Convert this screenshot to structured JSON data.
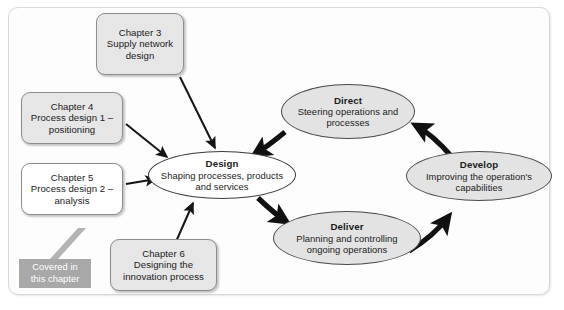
{
  "figure": {
    "frame_color": "#d8d8d8",
    "background": "#ffffff"
  },
  "cycle": {
    "nodes": [
      {
        "id": "design",
        "title": "Design",
        "subtitle": "Shaping processes, products and services",
        "fill": "#ffffff",
        "highlighted": true
      },
      {
        "id": "direct",
        "title": "Direct",
        "subtitle": "Steering operations and processes",
        "fill": "#e3e3e3",
        "highlighted": false
      },
      {
        "id": "develop",
        "title": "Develop",
        "subtitle": "Improving the operation's capabilities",
        "fill": "#e3e3e3",
        "highlighted": false
      },
      {
        "id": "deliver",
        "title": "Deliver",
        "subtitle": "Planning and controlling ongoing operations",
        "fill": "#e3e3e3",
        "highlighted": false
      }
    ],
    "flow_order": [
      "design",
      "deliver",
      "develop",
      "direct",
      "design"
    ]
  },
  "chapters": [
    {
      "id": "chapter-3",
      "title": "Chapter 3",
      "subtitle": "Supply network design",
      "fill": "#e6e6e6",
      "points_to": "design"
    },
    {
      "id": "chapter-4",
      "title": "Chapter 4",
      "subtitle": "Process design 1 – positioning",
      "fill": "#e6e6e6",
      "points_to": "design"
    },
    {
      "id": "chapter-5",
      "title": "Chapter 5",
      "subtitle": "Process design 2 – analysis",
      "fill": "#ffffff",
      "points_to": "design"
    },
    {
      "id": "chapter-6",
      "title": "Chapter 6",
      "subtitle": "Designing the innovation process",
      "fill": "#e6e6e6",
      "points_to": "design"
    }
  ],
  "callout": {
    "line1": "Covered in",
    "line2": "this chapter",
    "fill": "#a8a8a8",
    "text_color": "#ffffff",
    "anchor": "chapter-5"
  }
}
